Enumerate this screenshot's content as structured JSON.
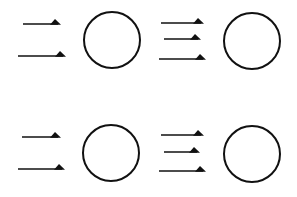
{
  "diagram": {
    "colors": {
      "stroke": "#111111",
      "background": "#ffffff"
    },
    "groups": [
      {
        "id": "top-left",
        "arrow_count": 2,
        "arrows": [
          {
            "x1": 23,
            "x2": 60,
            "y": 24
          },
          {
            "x1": 18,
            "x2": 65,
            "y": 56
          }
        ],
        "circle": {
          "cx": 112,
          "cy": 40,
          "r": 28
        }
      },
      {
        "id": "top-right",
        "arrow_count": 3,
        "arrows": [
          {
            "x1": 161,
            "x2": 203,
            "y": 23
          },
          {
            "x1": 164,
            "x2": 200,
            "y": 39
          },
          {
            "x1": 159,
            "x2": 205,
            "y": 59
          }
        ],
        "circle": {
          "cx": 252,
          "cy": 41,
          "r": 28
        }
      },
      {
        "id": "bottom-left",
        "arrow_count": 2,
        "arrows": [
          {
            "x1": 22,
            "x2": 60,
            "y": 137
          },
          {
            "x1": 18,
            "x2": 64,
            "y": 169
          }
        ],
        "circle": {
          "cx": 111,
          "cy": 153,
          "r": 28
        }
      },
      {
        "id": "bottom-right",
        "arrow_count": 3,
        "arrows": [
          {
            "x1": 161,
            "x2": 203,
            "y": 135
          },
          {
            "x1": 164,
            "x2": 199,
            "y": 152
          },
          {
            "x1": 159,
            "x2": 205,
            "y": 171
          }
        ],
        "circle": {
          "cx": 252,
          "cy": 154,
          "r": 28
        }
      }
    ]
  }
}
